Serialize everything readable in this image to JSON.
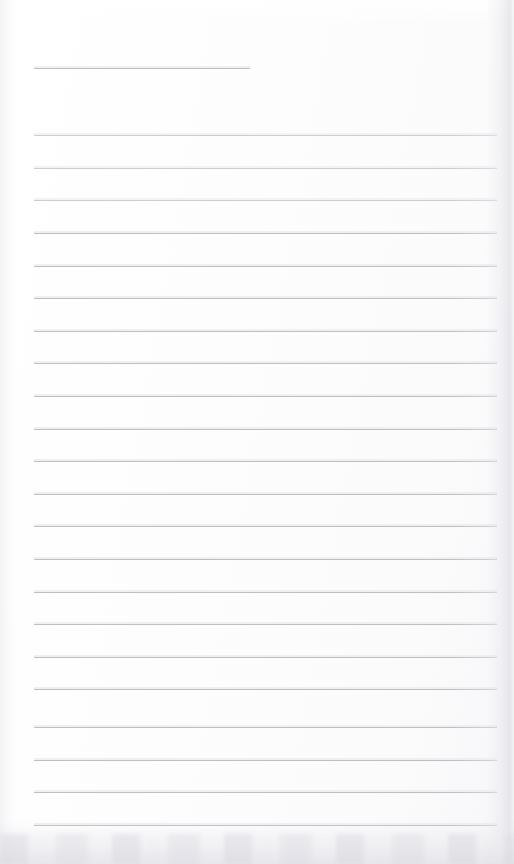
{
  "document": {
    "type": "scanned-blank-lined-page",
    "title": "Blank Lined Notebook Page",
    "description": "A scanned blank ruled page with one short rule near the top followed by a column of full-width horizontal ruled lines.",
    "page_width": 514,
    "page_height": 864,
    "text_content": "",
    "handwriting_present": "no",
    "printed_text_present": "no"
  },
  "paper": {
    "background_color": "#fdfdfd",
    "base_tint": "#fbfbfc",
    "edge_shade_color": "#e0e0e6",
    "bottom_smudge_color": "#d4d4db"
  },
  "rules": {
    "line_color": "#b9b9bf",
    "line_thickness_px": 1,
    "count_total": 23,
    "count_short": 1,
    "count_full_width": 22,
    "spacing_px": 32.6,
    "left_margin_px": 34,
    "right_margin_px": 497,
    "short_rule_right_px": 250,
    "items": [
      {
        "index": 1,
        "y": 68,
        "x_start": 34,
        "x_end": 250,
        "width_class": "short",
        "faint": false
      },
      {
        "index": 2,
        "y": 135,
        "x_start": 34,
        "x_end": 497,
        "width_class": "full",
        "faint": true
      },
      {
        "index": 3,
        "y": 168,
        "x_start": 34,
        "x_end": 497,
        "width_class": "full",
        "faint": true
      },
      {
        "index": 4,
        "y": 200,
        "x_start": 34,
        "x_end": 497,
        "width_class": "full",
        "faint": true
      },
      {
        "index": 5,
        "y": 233,
        "x_start": 34,
        "x_end": 497,
        "width_class": "full",
        "faint": false
      },
      {
        "index": 6,
        "y": 266,
        "x_start": 34,
        "x_end": 497,
        "width_class": "full",
        "faint": false
      },
      {
        "index": 7,
        "y": 298,
        "x_start": 34,
        "x_end": 497,
        "width_class": "full",
        "faint": false
      },
      {
        "index": 8,
        "y": 331,
        "x_start": 34,
        "x_end": 497,
        "width_class": "full",
        "faint": false
      },
      {
        "index": 9,
        "y": 363,
        "x_start": 34,
        "x_end": 497,
        "width_class": "full",
        "faint": false
      },
      {
        "index": 10,
        "y": 396,
        "x_start": 34,
        "x_end": 497,
        "width_class": "full",
        "faint": false
      },
      {
        "index": 11,
        "y": 429,
        "x_start": 34,
        "x_end": 497,
        "width_class": "full",
        "faint": false
      },
      {
        "index": 12,
        "y": 461,
        "x_start": 34,
        "x_end": 497,
        "width_class": "full",
        "faint": false
      },
      {
        "index": 13,
        "y": 494,
        "x_start": 34,
        "x_end": 497,
        "width_class": "full",
        "faint": false
      },
      {
        "index": 14,
        "y": 526,
        "x_start": 34,
        "x_end": 497,
        "width_class": "full",
        "faint": false
      },
      {
        "index": 15,
        "y": 559,
        "x_start": 34,
        "x_end": 497,
        "width_class": "full",
        "faint": false
      },
      {
        "index": 16,
        "y": 592,
        "x_start": 34,
        "x_end": 497,
        "width_class": "full",
        "faint": false
      },
      {
        "index": 17,
        "y": 624,
        "x_start": 34,
        "x_end": 497,
        "width_class": "full",
        "faint": false
      },
      {
        "index": 18,
        "y": 657,
        "x_start": 34,
        "x_end": 497,
        "width_class": "full",
        "faint": false
      },
      {
        "index": 19,
        "y": 689,
        "x_start": 34,
        "x_end": 497,
        "width_class": "full",
        "faint": false
      },
      {
        "index": 20,
        "y": 727,
        "x_start": 34,
        "x_end": 497,
        "width_class": "full",
        "faint": false
      },
      {
        "index": 21,
        "y": 760,
        "x_start": 34,
        "x_end": 497,
        "width_class": "full",
        "faint": false
      },
      {
        "index": 22,
        "y": 792,
        "x_start": 34,
        "x_end": 497,
        "width_class": "full",
        "faint": false
      },
      {
        "index": 23,
        "y": 825,
        "x_start": 34,
        "x_end": 497,
        "width_class": "full",
        "faint": false
      }
    ]
  }
}
